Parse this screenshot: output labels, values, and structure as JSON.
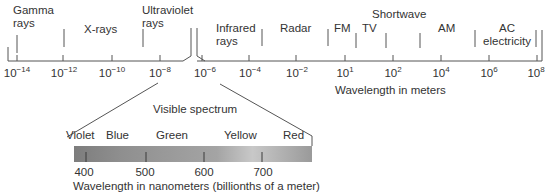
{
  "axis": {
    "label": "Wavelength in meters",
    "ticks_left": [
      {
        "base": "10",
        "exp": "−14"
      },
      {
        "base": "10",
        "exp": "−12"
      },
      {
        "base": "10",
        "exp": "−10"
      },
      {
        "base": "10",
        "exp": "−8"
      }
    ],
    "ticks_right": [
      {
        "base": "10",
        "exp": "−6"
      },
      {
        "base": "10",
        "exp": "−4"
      },
      {
        "base": "10",
        "exp": "−2"
      },
      {
        "base": "10",
        "exp": "1"
      },
      {
        "base": "10",
        "exp": "2"
      },
      {
        "base": "10",
        "exp": "4"
      },
      {
        "base": "10",
        "exp": "6"
      },
      {
        "base": "10",
        "exp": "8"
      }
    ]
  },
  "bands": [
    {
      "line1": "Gamma",
      "line2": "rays"
    },
    {
      "line1": "X-rays",
      "line2": ""
    },
    {
      "line1": "Ultraviolet",
      "line2": "rays"
    },
    {
      "line1": "Infrared",
      "line2": "rays"
    },
    {
      "line1": "Radar",
      "line2": ""
    },
    {
      "line1": "FM",
      "line2": ""
    },
    {
      "line1": "TV",
      "line2": ""
    },
    {
      "line1": "Shortwave",
      "line2": ""
    },
    {
      "line1": "AM",
      "line2": ""
    },
    {
      "line1": "AC",
      "line2": "electricity"
    }
  ],
  "visible": {
    "title": "Visible spectrum",
    "colors": [
      "Violet",
      "Blue",
      "Green",
      "Yellow",
      "Red"
    ],
    "ticks": [
      "400",
      "500",
      "600",
      "700"
    ],
    "axis_label": "Wavelength in nanometers (billionths of a meter)"
  }
}
